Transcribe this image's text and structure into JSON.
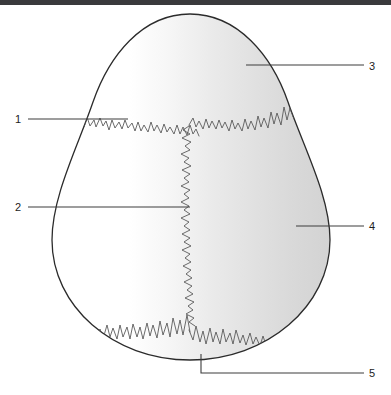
{
  "page": {
    "background_color": "#ffffff",
    "width": 391,
    "height": 395
  },
  "top_bar": {
    "color": "#3a3a3c",
    "height_px": 5
  },
  "figure": {
    "shape_name": "egg",
    "outline_color": "#2b2b2b",
    "fill_gradient_from": "#ffffff",
    "fill_gradient_to": "#d6d6d6",
    "suture_line_color": "#5a5a5a",
    "leader_line_color": "#3c3c3c",
    "label_text_color": "#1c1c1c"
  },
  "callouts": [
    {
      "id": "callout-1",
      "label": "1",
      "side": "left",
      "label_x": 18,
      "label_y": 123,
      "line": "M28,119 L128,119",
      "description": "upper horizontal suture line"
    },
    {
      "id": "callout-2",
      "label": "2",
      "side": "left",
      "label_x": 18,
      "label_y": 211,
      "line": "M28,207 L190,207",
      "description": "vertical central suture line"
    },
    {
      "id": "callout-3",
      "label": "3",
      "side": "right",
      "label_x": 369,
      "label_y": 70,
      "line": "M246,65 L364,65",
      "description": "upper shell region"
    },
    {
      "id": "callout-4",
      "label": "4",
      "side": "right",
      "label_x": 369,
      "label_y": 230,
      "line": "M296,226 L364,226",
      "description": "right shell region"
    },
    {
      "id": "callout-5",
      "label": "5",
      "side": "right",
      "label_x": 369,
      "label_y": 377,
      "line": "M201,354 L201,373 L364,373",
      "description": "lower shell region"
    }
  ]
}
